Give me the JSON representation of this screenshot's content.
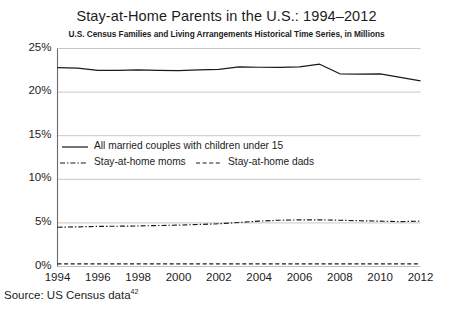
{
  "chart_data": {
    "type": "line",
    "title": "Stay-at-Home Parents in the U.S.: 1994–2012",
    "subtitle": "U.S. Census Families and Living Arrangements Historical Time Series, in Millions",
    "xlabel": "",
    "ylabel": "",
    "xlim": [
      1994,
      2012
    ],
    "ylim": [
      0,
      25
    ],
    "grid": true,
    "legend_position": "inside-left-middle",
    "ytick_labels": [
      "0%",
      "5%",
      "10%",
      "15%",
      "20%",
      "25%"
    ],
    "ytick_values": [
      0,
      5,
      10,
      15,
      20,
      25
    ],
    "xtick_labels": [
      "1994",
      "1996",
      "1998",
      "2000",
      "2002",
      "2004",
      "2006",
      "2008",
      "2010",
      "2012"
    ],
    "xtick_values": [
      1994,
      1996,
      1998,
      2000,
      2002,
      2004,
      2006,
      2008,
      2010,
      2012
    ],
    "x": [
      1994,
      1995,
      1996,
      1997,
      1998,
      1999,
      2000,
      2001,
      2002,
      2003,
      2004,
      2005,
      2006,
      2007,
      2008,
      2009,
      2010,
      2011,
      2012
    ],
    "series": [
      {
        "name": "All married couples with children under 15",
        "style": "solid",
        "color": "#1a1a1a",
        "values": [
          22.8,
          22.75,
          22.5,
          22.5,
          22.55,
          22.5,
          22.45,
          22.55,
          22.6,
          22.9,
          22.85,
          22.85,
          22.9,
          23.2,
          22.1,
          22.05,
          22.1,
          21.7,
          21.3
        ]
      },
      {
        "name": "Stay-at-home moms",
        "style": "dash-dot",
        "color": "#1a1a1a",
        "values": [
          4.5,
          4.55,
          4.6,
          4.62,
          4.65,
          4.7,
          4.75,
          4.82,
          4.9,
          5.05,
          5.2,
          5.3,
          5.35,
          5.35,
          5.3,
          5.25,
          5.2,
          5.15,
          5.2
        ]
      },
      {
        "name": "Stay-at-home dads",
        "style": "dashed",
        "color": "#1a1a1a",
        "values": [
          0.3,
          0.3,
          0.3,
          0.3,
          0.3,
          0.3,
          0.3,
          0.3,
          0.3,
          0.3,
          0.3,
          0.3,
          0.3,
          0.3,
          0.3,
          0.3,
          0.3,
          0.3,
          0.3
        ]
      }
    ],
    "legend": [
      {
        "label": "All married couples with children under 15",
        "style": "solid"
      },
      {
        "label": "Stay-at-home moms",
        "style": "dash-dot"
      },
      {
        "label": "Stay-at-home dads",
        "style": "dashed"
      }
    ]
  },
  "source": {
    "prefix": "Source: US Census data",
    "footnote": "42"
  },
  "colors": {
    "ink": "#1a1a1a",
    "grid": "#b9b9b9",
    "axis": "#6a6a6a",
    "background": "#ffffff"
  }
}
